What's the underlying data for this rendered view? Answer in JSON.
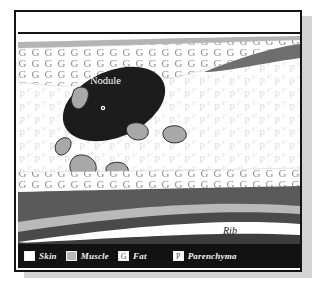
{
  "figure": {
    "title_strip_text": "",
    "caption": ""
  },
  "diagram": {
    "type": "anatomical-cross-section",
    "annotations": [
      {
        "id": "nodule",
        "label": "Nodule",
        "x": 93,
        "y": 57,
        "text_color": "#ffffff"
      },
      {
        "id": "rib",
        "label": "Rib",
        "x": 222,
        "y": 208,
        "text_color": "#1a1a1a"
      }
    ],
    "layers": [
      {
        "name": "skin",
        "color": "#ffffff",
        "position": "top-and-bottom-outer-band"
      },
      {
        "name": "muscle",
        "color": "#b9b9b9",
        "position": "band-below-skin"
      },
      {
        "name": "fat",
        "color": "#ffffff",
        "hatch_glyph": "G",
        "hatch_color": "#9a9a9a",
        "position": "subcutaneous-band"
      },
      {
        "name": "parenchyma",
        "color": "#ffffff",
        "hatch_glyph": "P",
        "hatch_color": "#e2e2e2",
        "position": "central-region"
      }
    ],
    "lesion": {
      "name": "nodule",
      "fill": "#1c1c1c",
      "shape": "ellipse-rotated",
      "satellite_count": 7,
      "satellite_fill": "#a8a8a8",
      "satellite_stroke": "#2b2b2b",
      "inner_marker": "small-white-dot"
    },
    "rib_layers": [
      {
        "name": "dark-tissue-upper",
        "color": "#595959"
      },
      {
        "name": "muscle-band",
        "color": "#b9b9b9"
      },
      {
        "name": "dark-tissue-lower",
        "color": "#4a4a4a"
      },
      {
        "name": "rib-bone",
        "color": "#ffffff"
      },
      {
        "name": "dark-tissue-bottom",
        "color": "#3d3d3d"
      }
    ]
  },
  "legend": {
    "items": [
      {
        "label": "Skin",
        "swatch_color": "#ffffff",
        "swatch_glyph": ""
      },
      {
        "label": "Muscle",
        "swatch_color": "#b9b9b9",
        "swatch_glyph": ""
      },
      {
        "label": "Fat",
        "swatch_color": "#ffffff",
        "swatch_glyph": "G"
      },
      {
        "label": "Parenchyma",
        "swatch_color": "#ffffff",
        "swatch_glyph": "P"
      }
    ]
  },
  "colors": {
    "frame_border": "#141414",
    "legend_background": "#121212",
    "legend_text": "#f2f2f2",
    "drop_shadow": "#d4d4d4",
    "nodule": "#1c1c1c",
    "muscle_gray": "#b9b9b9",
    "dark_tissue": "#595959"
  }
}
